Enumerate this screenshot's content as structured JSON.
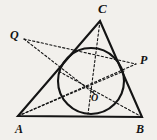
{
  "figure": {
    "kind": "geometry-diagram",
    "background_color": "#f2f0ec",
    "stroke_color": "#141414",
    "width": 157,
    "height": 140
  },
  "labels": {
    "vertex_c": "C",
    "vertex_a": "A",
    "vertex_b": "B",
    "point_p": "P",
    "point_q": "Q",
    "center_o": "O"
  },
  "geometry": {
    "triangle": {
      "name": "triangle-abc",
      "vertices": [
        {
          "name": "A",
          "x": 18,
          "y": 116
        },
        {
          "name": "B",
          "x": 142,
          "y": 117
        },
        {
          "name": "C",
          "x": 100,
          "y": 21
        }
      ],
      "stroke_width": 2.1,
      "style": "solid"
    },
    "incircle": {
      "name": "inscribed-circle",
      "cx": 91,
      "cy": 81,
      "r": 33,
      "stroke_width": 2.1,
      "style": "solid"
    },
    "center_point": {
      "name": "O",
      "x": 93,
      "y": 92,
      "dot_r": 1.1
    },
    "external_points": [
      {
        "name": "P",
        "x": 136,
        "y": 64
      },
      {
        "name": "Q",
        "x": 24,
        "y": 39
      }
    ],
    "tangent_points": [
      {
        "name": "tangent-on-ac",
        "x": 65,
        "y": 68
      },
      {
        "name": "tangent-on-bc",
        "x": 121,
        "y": 72
      },
      {
        "name": "tangent-on-ab",
        "x": 91,
        "y": 114
      }
    ],
    "dashed_lines": [
      {
        "name": "line-q-to-p",
        "x1": 24,
        "y1": 39,
        "x2": 136,
        "y2": 64
      },
      {
        "name": "line-c-to-o-extended",
        "x1": 100,
        "y1": 21,
        "x2": 88,
        "y2": 114
      },
      {
        "name": "line-a-to-o-extended",
        "x1": 18,
        "y1": 116,
        "x2": 136,
        "y2": 64
      },
      {
        "name": "line-b-to-o-extended",
        "x1": 142,
        "y1": 117,
        "x2": 60,
        "y2": 72
      },
      {
        "name": "line-a-to-bc-tangent",
        "x1": 18,
        "y1": 116,
        "x2": 121,
        "y2": 72
      },
      {
        "name": "line-q-through-ac",
        "x1": 24,
        "y1": 39,
        "x2": 93,
        "y2": 92
      }
    ],
    "dash_pattern": "2.2 2.2",
    "dash_width": 1.1
  },
  "label_positions": {
    "vertex_c": {
      "x": 98,
      "y": 2
    },
    "vertex_a": {
      "x": 15,
      "y": 123
    },
    "vertex_b": {
      "x": 136,
      "y": 123
    },
    "point_p": {
      "x": 140,
      "y": 54
    },
    "point_q": {
      "x": 10,
      "y": 29
    },
    "center_o": {
      "x": 91,
      "y": 93
    }
  }
}
